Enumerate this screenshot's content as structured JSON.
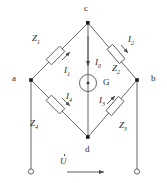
{
  "figure": {
    "line_color": "#55555a",
    "text_color": "#2b2b2b",
    "node_fill": "#1b1b1b",
    "terminal_stroke": "#55555a"
  },
  "nodes": [
    {
      "id": "c",
      "label": "c",
      "x": 88,
      "y": 23
    },
    {
      "id": "a",
      "label": "a",
      "x": 31,
      "y": 80
    },
    {
      "id": "b",
      "label": "b",
      "x": 137,
      "y": 80
    },
    {
      "id": "d",
      "label": "d",
      "x": 88,
      "y": 137
    }
  ],
  "impedances": [
    {
      "id": "Z1",
      "base": "Z",
      "sub": "1",
      "branch": "a-c"
    },
    {
      "id": "Z2",
      "base": "Z",
      "sub": "2",
      "branch": "c-b"
    },
    {
      "id": "Z3",
      "base": "Z",
      "sub": "3",
      "branch": "d-b"
    },
    {
      "id": "Z4",
      "base": "Z",
      "sub": "4",
      "branch": "a-d"
    }
  ],
  "currents": [
    {
      "id": "I1",
      "base": "I",
      "sub": "1",
      "branch": "a-c"
    },
    {
      "id": "I2",
      "base": "I",
      "sub": "2",
      "branch": "c-b"
    },
    {
      "id": "I3",
      "base": "I",
      "sub": "3",
      "branch": "d-b"
    },
    {
      "id": "I4",
      "base": "I",
      "sub": "4",
      "branch": "a-d"
    },
    {
      "id": "I0",
      "base": "I",
      "sub": "0",
      "branch": "c-d"
    }
  ],
  "galvanometer": {
    "label": "G",
    "symbol": "circle-with-dot"
  },
  "source": {
    "label": "U",
    "sub": "",
    "notation": "phasor-dot",
    "arrow": "right"
  },
  "terminals": [
    {
      "id": "terminal-left",
      "x": 31,
      "y": 172
    },
    {
      "id": "terminal-right",
      "x": 137,
      "y": 172
    }
  ]
}
